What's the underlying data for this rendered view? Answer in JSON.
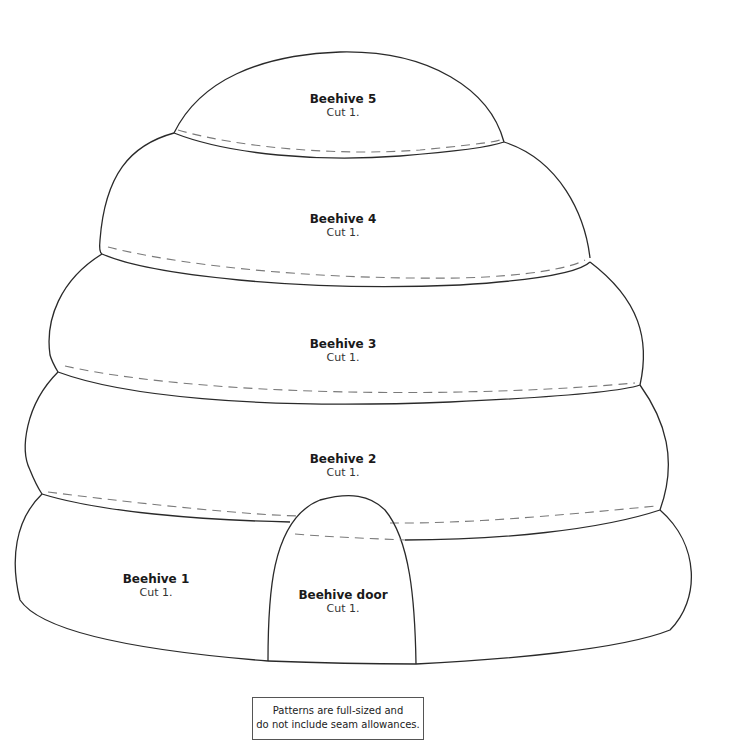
{
  "pieces": [
    {
      "id": "beehive5",
      "title": "Beehive 5",
      "cut": "Cut 1."
    },
    {
      "id": "beehive4",
      "title": "Beehive 4",
      "cut": "Cut 1."
    },
    {
      "id": "beehive3",
      "title": "Beehive 3",
      "cut": "Cut 1."
    },
    {
      "id": "beehive2",
      "title": "Beehive 2",
      "cut": "Cut 1."
    },
    {
      "id": "beehive1",
      "title": "Beehive 1",
      "cut": "Cut 1."
    },
    {
      "id": "door",
      "title": "Beehive door",
      "cut": "Cut 1."
    }
  ],
  "note": {
    "line1": "Patterns are full-sized and",
    "line2": "do not include seam allowances."
  },
  "colors": {
    "outline": "#2a2a2a",
    "seam": "#7a7a7a"
  }
}
